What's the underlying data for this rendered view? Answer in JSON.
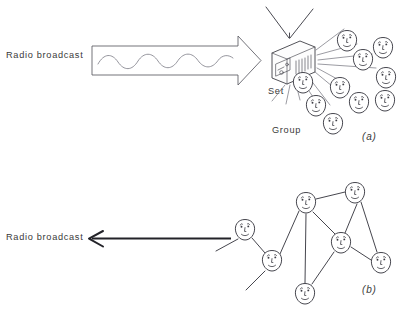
{
  "figure": {
    "background_color": "#ffffff",
    "ink_color": "#3c3c44",
    "width": 400,
    "height": 312
  },
  "panels": [
    {
      "id": "a",
      "letter": "(a)",
      "letter_position": {
        "x": 362,
        "y": 140
      },
      "broadcast_label": "Radio broadcast",
      "broadcast_label_position": {
        "x": 6,
        "y": 58
      },
      "set_label": "Set",
      "set_label_position": {
        "x": 268,
        "y": 94
      },
      "group_label": "Group",
      "group_label_position": {
        "x": 272,
        "y": 133
      },
      "arrow": {
        "type": "block-arrow-with-wave",
        "direction": "right",
        "x1": 90,
        "x2": 258,
        "y": 60,
        "wave_cycles": 4
      },
      "receiver": {
        "name": "radio-set",
        "x": 272,
        "y": 42,
        "width": 40,
        "height": 34,
        "antennas": 2
      },
      "rays": {
        "count": 11,
        "origin": {
          "x": 300,
          "y": 66
        }
      },
      "faces": [
        {
          "x": 347,
          "y": 41
        },
        {
          "x": 383,
          "y": 48
        },
        {
          "x": 363,
          "y": 60
        },
        {
          "x": 386,
          "y": 78
        },
        {
          "x": 340,
          "y": 88
        },
        {
          "x": 385,
          "y": 101
        },
        {
          "x": 359,
          "y": 103
        },
        {
          "x": 316,
          "y": 106
        },
        {
          "x": 303,
          "y": 83
        },
        {
          "x": 333,
          "y": 124
        }
      ],
      "face_count": 10
    },
    {
      "id": "b",
      "letter": "(b)",
      "letter_position": {
        "x": 362,
        "y": 293
      },
      "broadcast_label": "Radio broadcast",
      "broadcast_label_position": {
        "x": 6,
        "y": 240
      },
      "arrow": {
        "type": "line-arrow",
        "direction": "left",
        "x1": 230,
        "x2": 88,
        "y": 240
      },
      "nodes": [
        {
          "id": "n1",
          "x": 245,
          "y": 230
        },
        {
          "id": "n2",
          "x": 272,
          "y": 261
        },
        {
          "id": "n3",
          "x": 306,
          "y": 203
        },
        {
          "id": "n4",
          "x": 355,
          "y": 193
        },
        {
          "id": "n5",
          "x": 341,
          "y": 243
        },
        {
          "id": "n6",
          "x": 381,
          "y": 263
        },
        {
          "id": "n7",
          "x": 305,
          "y": 294
        }
      ],
      "node_count": 7,
      "edges": [
        {
          "from": "n1",
          "to": "n2"
        },
        {
          "from": "n2",
          "to": "n3"
        },
        {
          "from": "n3",
          "to": "n4"
        },
        {
          "from": "n3",
          "to": "n5"
        },
        {
          "from": "n3",
          "to": "n7"
        },
        {
          "from": "n4",
          "to": "n5"
        },
        {
          "from": "n4",
          "to": "n6"
        },
        {
          "from": "n5",
          "to": "n6"
        },
        {
          "from": "n5",
          "to": "n7"
        }
      ],
      "dangling_edges": [
        {
          "from": "n1",
          "to": {
            "x": 216,
            "y": 248
          }
        },
        {
          "from": "n2",
          "to": {
            "x": 243,
            "y": 288
          }
        }
      ]
    }
  ]
}
